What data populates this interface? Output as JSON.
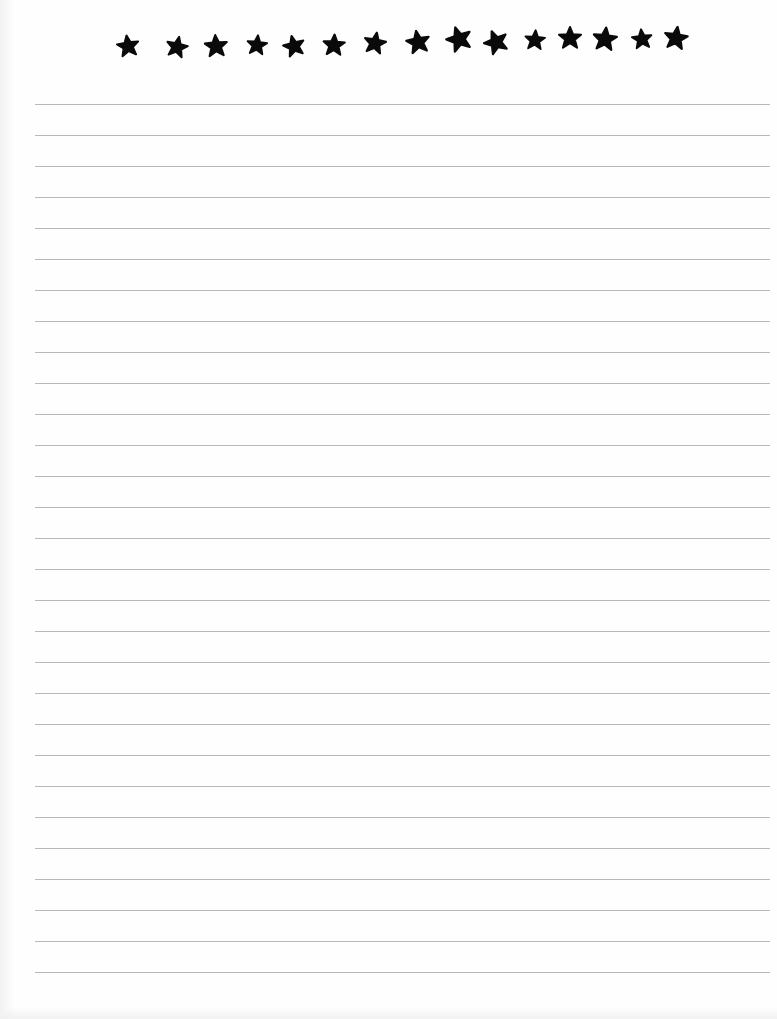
{
  "document": {
    "type": "lined-paper",
    "background_color": "#ffffff",
    "line_color": "#b9b9b9",
    "star_color": "#0a0a0a"
  },
  "header": {
    "star_count": 15,
    "stars": [
      {
        "icon": "star-icon",
        "x": 128,
        "y": 46,
        "rotate": -8,
        "scale": 0.92
      },
      {
        "icon": "star-icon",
        "x": 177,
        "y": 47,
        "rotate": 12,
        "scale": 0.9
      },
      {
        "icon": "star-icon",
        "x": 216,
        "y": 46,
        "rotate": -4,
        "scale": 0.95
      },
      {
        "icon": "star-icon",
        "x": 257,
        "y": 45,
        "rotate": 6,
        "scale": 0.85
      },
      {
        "icon": "star-icon",
        "x": 294,
        "y": 46,
        "rotate": -14,
        "scale": 0.9
      },
      {
        "icon": "star-icon",
        "x": 334,
        "y": 45,
        "rotate": 3,
        "scale": 0.92
      },
      {
        "icon": "star-icon",
        "x": 375,
        "y": 43,
        "rotate": 10,
        "scale": 0.92
      },
      {
        "icon": "star-icon",
        "x": 418,
        "y": 42,
        "rotate": -10,
        "scale": 0.98
      },
      {
        "icon": "star-icon",
        "x": 459,
        "y": 39,
        "rotate": -18,
        "scale": 1.05
      },
      {
        "icon": "star-icon",
        "x": 496,
        "y": 42,
        "rotate": -22,
        "scale": 1.0
      },
      {
        "icon": "star-icon",
        "x": 535,
        "y": 40,
        "rotate": 4,
        "scale": 0.85
      },
      {
        "icon": "star-icon",
        "x": 570,
        "y": 38,
        "rotate": 0,
        "scale": 0.95
      },
      {
        "icon": "star-icon",
        "x": 605,
        "y": 39,
        "rotate": 6,
        "scale": 1.0
      },
      {
        "icon": "star-icon",
        "x": 642,
        "y": 39,
        "rotate": -6,
        "scale": 0.85
      },
      {
        "icon": "star-icon",
        "x": 676,
        "y": 38,
        "rotate": 8,
        "scale": 0.98
      }
    ]
  },
  "ruled_area": {
    "line_count": 29,
    "first_line_y": 104,
    "line_spacing": 31,
    "line_left": 35,
    "line_width": 735
  }
}
